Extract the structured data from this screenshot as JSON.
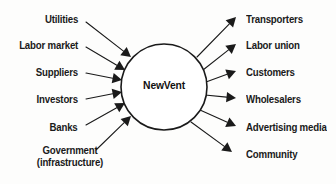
{
  "diagram": {
    "center": {
      "label": "NewVent",
      "shape": "circle",
      "cx": 164,
      "cy": 87,
      "r": 43
    },
    "style": {
      "stroke_color": "#1a1a1a",
      "text_color": "#1a1a1a",
      "background_color": "#fdfdfc",
      "line_width": 1.1
    },
    "inputs": [
      {
        "label": "Utilities",
        "label_x": 78,
        "label_y": 20,
        "tip_x": 131,
        "tip_y": 57,
        "tail_x": 86,
        "tail_y": 22
      },
      {
        "label": "Labor market",
        "label_x": 78,
        "label_y": 46,
        "tip_x": 125,
        "tip_y": 70,
        "tail_x": 86,
        "tail_y": 47
      },
      {
        "label": "Suppliers",
        "label_x": 78,
        "label_y": 73,
        "tip_x": 122,
        "tip_y": 80,
        "tail_x": 86,
        "tail_y": 73
      },
      {
        "label": "Investors",
        "label_x": 78,
        "label_y": 100,
        "tip_x": 122,
        "tip_y": 92,
        "tail_x": 86,
        "tail_y": 99
      },
      {
        "label": "Banks",
        "label_x": 78,
        "label_y": 128,
        "tip_x": 125,
        "tip_y": 103,
        "tail_x": 86,
        "tail_y": 125
      },
      {
        "label_line1": "Government",
        "label_line2": "(infrastructure)",
        "label_x": 70,
        "label_y": 157,
        "tip_x": 131,
        "tip_y": 116,
        "tail_x": 96,
        "tail_y": 150
      }
    ],
    "outputs": [
      {
        "label": "Transporters",
        "label_x": 246,
        "label_y": 20,
        "tip_x": 236,
        "tip_y": 17,
        "tail_x": 197,
        "tail_y": 57
      },
      {
        "label": "Labor union",
        "label_x": 246,
        "label_y": 46,
        "tip_x": 236,
        "tip_y": 44,
        "tail_x": 203,
        "tail_y": 70
      },
      {
        "label": "Customers",
        "label_x": 246,
        "label_y": 73,
        "tip_x": 236,
        "tip_y": 71,
        "tail_x": 206,
        "tail_y": 82
      },
      {
        "label": "Wholesalers",
        "label_x": 246,
        "label_y": 100,
        "tip_x": 236,
        "tip_y": 98,
        "tail_x": 205,
        "tail_y": 95
      },
      {
        "label": "Advertising media",
        "label_x": 246,
        "label_y": 128,
        "tip_x": 236,
        "tip_y": 126,
        "tail_x": 200,
        "tail_y": 110
      },
      {
        "label": "Community",
        "label_x": 246,
        "label_y": 155,
        "tip_x": 232,
        "tip_y": 152,
        "tail_x": 191,
        "tail_y": 122
      }
    ]
  }
}
